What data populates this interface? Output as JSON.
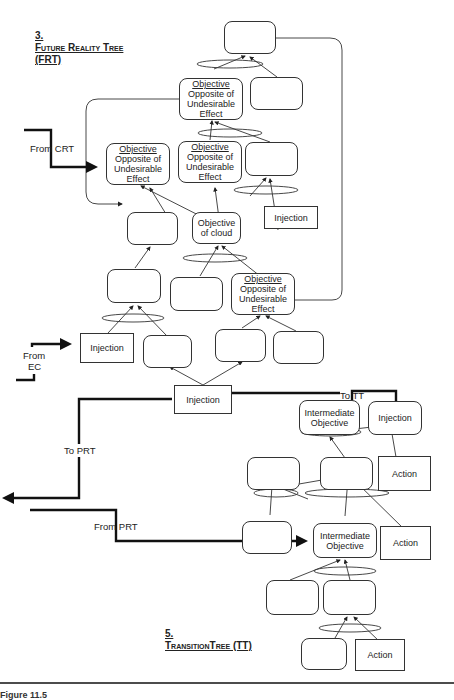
{
  "frt": {
    "heading_num": "3.",
    "heading_title": "Future Reality Tree",
    "heading_abbr": "(FRT)",
    "nodes": {
      "top": "",
      "obj_top_title": "Objective",
      "obj_top_body": "Opposite of Undesirable Effect",
      "top_right": "",
      "obj_left_title": "Objective",
      "obj_left_body": "Opposite of Undesirable Effect",
      "obj_mid_title": "Objective",
      "obj_mid_body": "Opposite of Undesirable Effect",
      "mid_right": "",
      "injection_right": "Injection",
      "left_mid": "",
      "cloud": "Objective of cloud",
      "left_lower": "",
      "center_lower": "",
      "obj_low_title": "Objective",
      "obj_low_body": "Opposite of Undesirable Effect",
      "injection_left": "Injection",
      "bottom_a": "",
      "bottom_b": "",
      "bottom_c": "",
      "injection_bottom": "Injection"
    },
    "connectors": {
      "from_crt": "From CRT",
      "from_ec_1": "From",
      "from_ec_2": "EC",
      "to_tt": "To TT",
      "to_prt": "To PRT"
    }
  },
  "tt": {
    "heading_num": "5.",
    "heading_title": "TransitionTree (TT)",
    "nodes": {
      "intermediate_top": "Intermediate Objective",
      "injection": "Injection",
      "left_box": "",
      "center_box": "",
      "action_top": "Action",
      "left_low": "",
      "intermediate_mid": "Intermediate Objective",
      "action_mid": "Action",
      "low_a": "",
      "low_b": "",
      "bottom_a": "",
      "action_bottom": "Action"
    },
    "connectors": {
      "from_prt": "From PRT"
    }
  },
  "caption": "Figure 11.5"
}
